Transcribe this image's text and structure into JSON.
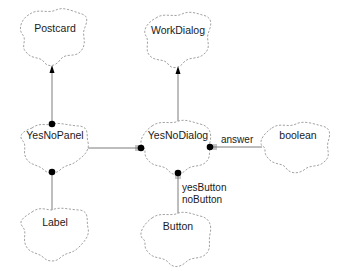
{
  "diagram": {
    "type": "Booch class diagram",
    "classes": [
      {
        "id": "postcard",
        "name": "Postcard"
      },
      {
        "id": "workdialog",
        "name": "WorkDialog"
      },
      {
        "id": "yesnopanel",
        "name": "YesNoPanel"
      },
      {
        "id": "yesnodialog",
        "name": "YesNoDialog"
      },
      {
        "id": "boolean",
        "name": "boolean"
      },
      {
        "id": "label",
        "name": "Label"
      },
      {
        "id": "button",
        "name": "Button"
      }
    ],
    "relationships": [
      {
        "from": "YesNoPanel",
        "to": "Postcard",
        "kind": "inheritance"
      },
      {
        "from": "YesNoDialog",
        "to": "WorkDialog",
        "kind": "inheritance"
      },
      {
        "from": "YesNoPanel",
        "to": "YesNoDialog",
        "kind": "has"
      },
      {
        "from": "YesNoDialog",
        "to": "boolean",
        "kind": "has",
        "label": "answer"
      },
      {
        "from": "YesNoPanel",
        "to": "Label",
        "kind": "has"
      },
      {
        "from": "YesNoDialog",
        "to": "Button",
        "kind": "has",
        "label_lines": [
          "yesButton",
          "noButton"
        ]
      }
    ]
  },
  "labels": {
    "postcard": "Postcard",
    "workdialog": "WorkDialog",
    "yesnopanel": "YesNoPanel",
    "yesnodialog": "YesNoDialog",
    "boolean": "boolean",
    "label": "Label",
    "button": "Button",
    "answer": "answer",
    "yesbutton": "yesButton",
    "nobutton": "noButton"
  },
  "colors": {
    "background": "#ffffff",
    "cloud_stroke": "#8a8a8a",
    "edge": "#6e6e6e",
    "marker": "#000000",
    "text": "#1a1a1a"
  }
}
